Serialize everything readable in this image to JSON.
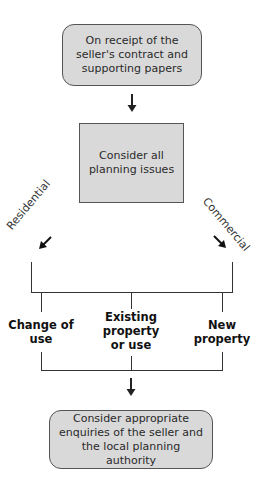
{
  "diagram": {
    "type": "flowchart",
    "nodes": {
      "start": {
        "text": "On receipt of the seller's contract and supporting papers",
        "shape": "rounded-rect"
      },
      "consider": {
        "text": "Consider all planning issues",
        "shape": "rect"
      },
      "end": {
        "text": "Consider appropriate enquiries of the seller and the local planning authority",
        "shape": "rounded-rect"
      }
    },
    "branches": {
      "left": "Residential",
      "right": "Commercial"
    },
    "options": [
      {
        "text": "Change of use"
      },
      {
        "text": "Existing property or use"
      },
      {
        "text": "New property"
      }
    ],
    "colors": {
      "box_fill": "#d9d9d9",
      "box_border": "#555555",
      "line": "#333333"
    }
  }
}
